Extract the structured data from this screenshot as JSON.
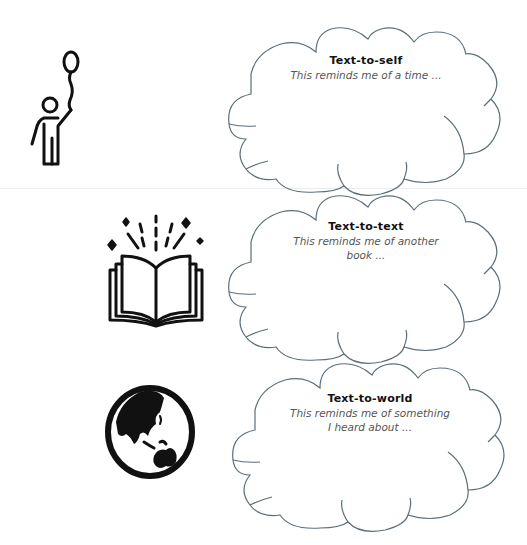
{
  "colors": {
    "cloud_stroke": "#5b6f79",
    "icon_stroke": "#111111",
    "divider": "#ececec",
    "title_text": "#111111",
    "prompt_text": "#555555"
  },
  "connections": [
    {
      "id": "self",
      "icon": "person-with-balloon-icon",
      "title": "Text-to-self",
      "prompt_lines": [
        "This reminds me of a time ..."
      ]
    },
    {
      "id": "text",
      "icon": "open-book-icon",
      "title": "Text-to-text",
      "prompt_lines": [
        "This reminds me of another",
        "book ..."
      ]
    },
    {
      "id": "world",
      "icon": "globe-icon",
      "title": "Text-to-world",
      "prompt_lines": [
        "This reminds me of something",
        "I heard about ..."
      ]
    }
  ]
}
